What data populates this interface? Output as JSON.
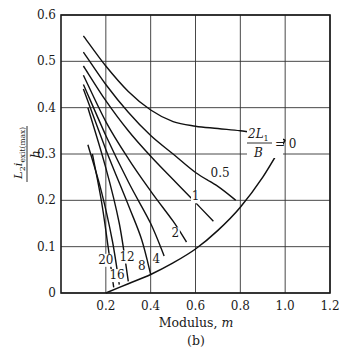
{
  "chart_data": {
    "type": "line",
    "title": "",
    "subtitle": "(b)",
    "xlabel": "Modulus, m",
    "ylabel": "L2 i_exit(max) / h",
    "ylabel_parts": {
      "numerator": "L",
      "sub2": "2",
      "i": "i",
      "sub_exit": "exit(max)",
      "denominator": "h"
    },
    "xlim": [
      0,
      1.2
    ],
    "ylim": [
      0,
      0.6
    ],
    "x_ticks": [
      0.2,
      0.4,
      0.6,
      0.8,
      1.0,
      1.2
    ],
    "x_tick_labels": [
      "0.2",
      "0.4",
      "0.6",
      "0.8",
      "1.0",
      "1.2"
    ],
    "y_ticks": [
      0,
      0.1,
      0.2,
      0.3,
      0.4,
      0.5,
      0.6
    ],
    "y_tick_labels": [
      "0",
      "0.1",
      "0.2",
      "0.3",
      "0.4",
      "0.5",
      "0.6"
    ],
    "grid": true,
    "legend": null,
    "parameter_name": "2L1/B",
    "parameter_label": {
      "num": "2L",
      "sub": "1",
      "den": "B",
      "eq": "= 0"
    },
    "boundary_curve": {
      "name": "envelope",
      "x": [
        0.2,
        0.3,
        0.4,
        0.5,
        0.6,
        0.7,
        0.8,
        0.9,
        1.0
      ],
      "y": [
        0.0,
        0.02,
        0.04,
        0.065,
        0.095,
        0.135,
        0.185,
        0.25,
        0.33
      ]
    },
    "series": [
      {
        "name": "0",
        "label": "2L1/B = 0",
        "x": [
          0.1,
          0.2,
          0.3,
          0.4,
          0.5,
          0.6,
          0.7,
          0.8,
          0.9,
          1.0
        ],
        "y": [
          0.555,
          0.49,
          0.435,
          0.395,
          0.37,
          0.36,
          0.355,
          0.35,
          0.343,
          0.33
        ]
      },
      {
        "name": "0.5",
        "label": "0.5",
        "x": [
          0.1,
          0.2,
          0.3,
          0.4,
          0.5,
          0.6,
          0.7,
          0.78
        ],
        "y": [
          0.52,
          0.45,
          0.39,
          0.34,
          0.3,
          0.26,
          0.23,
          0.2
        ]
      },
      {
        "name": "1",
        "label": "1",
        "x": [
          0.1,
          0.2,
          0.3,
          0.4,
          0.5,
          0.6,
          0.68
        ],
        "y": [
          0.49,
          0.415,
          0.35,
          0.295,
          0.245,
          0.195,
          0.155
        ]
      },
      {
        "name": "2",
        "label": "2",
        "x": [
          0.1,
          0.2,
          0.3,
          0.4,
          0.5,
          0.56
        ],
        "y": [
          0.47,
          0.37,
          0.29,
          0.22,
          0.155,
          0.11
        ]
      },
      {
        "name": "4",
        "label": "4",
        "x": [
          0.1,
          0.2,
          0.3,
          0.4,
          0.46
        ],
        "y": [
          0.45,
          0.34,
          0.24,
          0.15,
          0.08
        ]
      },
      {
        "name": "8",
        "label": "8",
        "x": [
          0.1,
          0.2,
          0.3,
          0.36,
          0.4
        ],
        "y": [
          0.44,
          0.31,
          0.19,
          0.115,
          0.04
        ]
      },
      {
        "name": "12",
        "label": "12",
        "x": [
          0.12,
          0.2,
          0.26,
          0.3
        ],
        "y": [
          0.4,
          0.27,
          0.15,
          0.025
        ]
      },
      {
        "name": "16",
        "label": "16",
        "x": [
          0.12,
          0.18,
          0.23,
          0.26
        ],
        "y": [
          0.32,
          0.22,
          0.11,
          0.018
        ]
      },
      {
        "name": "20",
        "label": "20",
        "x": [
          0.14,
          0.18,
          0.21,
          0.235
        ],
        "y": [
          0.3,
          0.2,
          0.1,
          0.012
        ]
      }
    ],
    "annotations": [
      {
        "text": "0.5",
        "x": 0.71,
        "y": 0.25
      },
      {
        "text": "1",
        "x": 0.6,
        "y": 0.2
      },
      {
        "text": "2",
        "x": 0.51,
        "y": 0.12
      },
      {
        "text": "4",
        "x": 0.425,
        "y": 0.065
      },
      {
        "text": "8",
        "x": 0.36,
        "y": 0.05
      },
      {
        "text": "12",
        "x": 0.295,
        "y": 0.07
      },
      {
        "text": "16",
        "x": 0.25,
        "y": 0.03
      },
      {
        "text": "20",
        "x": 0.2,
        "y": 0.063
      }
    ]
  }
}
